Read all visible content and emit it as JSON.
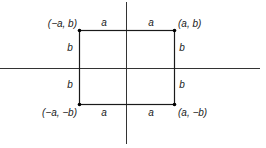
{
  "diagram": {
    "type": "coordinate-rectangle",
    "colors": {
      "line": "#1a1a1a",
      "axis": "#333333",
      "background": "#ffffff"
    },
    "axes": {
      "x_axis": {
        "from": [
          0,
          68
        ],
        "to": [
          260,
          68
        ]
      },
      "y_axis": {
        "from": [
          126,
          2
        ],
        "to": [
          126,
          144
        ]
      }
    },
    "rectangle": {
      "x": 79,
      "y": 30,
      "width": 95,
      "height": 74
    },
    "corners": {
      "top_left": {
        "label": "(−a, b)",
        "point": [
          79,
          30
        ]
      },
      "top_right": {
        "label": "(a, b)",
        "point": [
          174,
          30
        ]
      },
      "bottom_left": {
        "label": "(−a, −b)",
        "point": [
          79,
          104
        ]
      },
      "bottom_right": {
        "label": "(a, −b)",
        "point": [
          174,
          104
        ]
      }
    },
    "segment_labels": {
      "top_left_a": "a",
      "top_right_a": "a",
      "bottom_left_a": "a",
      "bottom_right_a": "a",
      "left_top_b": "b",
      "left_bottom_b": "b",
      "right_top_b": "b",
      "right_bottom_b": "b"
    }
  }
}
